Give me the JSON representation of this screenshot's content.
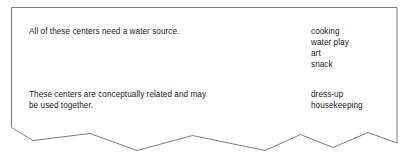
{
  "card": {
    "style_note": "torn-paper panel with ragged bottom edge",
    "border_color": "#7d7d7d",
    "background_color": "#ffffff",
    "text_color": "#1c1c1c"
  },
  "rows": [
    {
      "description": "All of these centers need a water source.",
      "centers": [
        "cooking",
        "water play",
        "art",
        "snack"
      ]
    },
    {
      "description": "These centers are conceptually related and may\nbe used together.",
      "centers": [
        "dress-up",
        "housekeeping"
      ]
    }
  ]
}
